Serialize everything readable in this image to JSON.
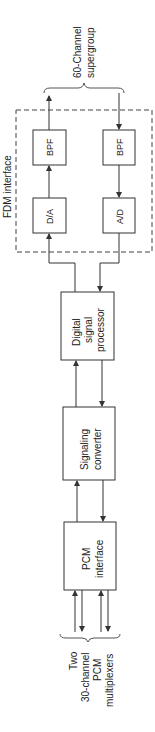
{
  "title": "FDM interface",
  "top_group": {
    "line1": "60-Channel",
    "line2": "supergroup"
  },
  "bottom_group": {
    "line1": "Two",
    "line2": "30-channel",
    "line3": "PCM",
    "line4": "multiplexers"
  },
  "blocks": {
    "bpf_tx": "BPF",
    "da": "D/A",
    "bpf_rx": "BPF",
    "ad": "A/D",
    "dsp": {
      "line1": "Digital",
      "line2": "signal",
      "line3": "processor"
    },
    "sig": {
      "line1": "Signaling",
      "line2": "converter"
    },
    "pcm": {
      "line1": "PCM",
      "line2": "interface"
    }
  },
  "colors": {
    "line": "#333333",
    "background": "#ffffff"
  }
}
